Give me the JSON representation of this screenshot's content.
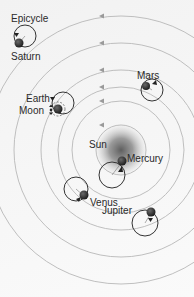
{
  "diagram": {
    "labels": {
      "epicycle": "Epicycle",
      "saturn": "Saturn",
      "mars": "Mars",
      "earth": "Earth",
      "moon": "Moon",
      "sun": "Sun",
      "mercury": "Mercury",
      "venus": "Venus",
      "jupiter": "Jupiter"
    },
    "center": {
      "name": "Sun",
      "x": 121,
      "y": 150
    },
    "orbits": [
      {
        "name": "Mercury",
        "radius": 25
      },
      {
        "name": "Venus",
        "radius": 49
      },
      {
        "name": "Earth",
        "radius": 63
      },
      {
        "name": "Mars",
        "radius": 80
      },
      {
        "name": "Jupiter",
        "radius": 107
      },
      {
        "name": "Saturn",
        "radius": 134
      }
    ],
    "bodies": [
      {
        "name": "Mercury",
        "x": 122,
        "y": 160,
        "epicycle_r": 13
      },
      {
        "name": "Venus",
        "x": 84,
        "y": 196,
        "epicycle_r": 12
      },
      {
        "name": "Earth",
        "x": 58,
        "y": 109,
        "epicycle_r": 11
      },
      {
        "name": "Mars",
        "x": 146,
        "y": 86,
        "epicycle_r": 11
      },
      {
        "name": "Jupiter",
        "x": 150,
        "y": 215,
        "epicycle_r": 13
      },
      {
        "name": "Saturn",
        "x": 19,
        "y": 43,
        "epicycle_r": 11
      }
    ],
    "colors": {
      "orbit": "#b5b5b5",
      "arrow": "#9a9a9a",
      "planet": "#2b2b2b",
      "epicycle": "#333333",
      "sun_glow": "#6e6e6e",
      "text": "#2a2a2a"
    }
  }
}
